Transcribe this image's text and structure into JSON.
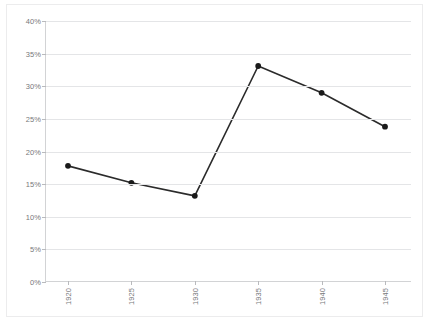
{
  "chart_data": {
    "type": "line",
    "title": "",
    "subtitle": "",
    "xlabel": "",
    "ylabel": "",
    "categories": [
      "1920",
      "1925",
      "1930",
      "1935",
      "1940",
      "1945"
    ],
    "x": [
      1920,
      1925,
      1930,
      1935,
      1940,
      1945
    ],
    "values": [
      17.8,
      15.2,
      13.2,
      33.1,
      29.0,
      23.8
    ],
    "value_labels": [
      "17.8%",
      "15.2%",
      "13.2%",
      "33.1%",
      "29.0%",
      "23.8%"
    ],
    "series": [
      {
        "name": "",
        "values": [
          17.8,
          15.2,
          13.2,
          33.1,
          29.0,
          23.8
        ]
      }
    ],
    "ylim": [
      0,
      40
    ],
    "ytick_step": 5,
    "ytick_labels": [
      "0%",
      "5%",
      "10%",
      "15%",
      "20%",
      "25%",
      "30%",
      "35%",
      "40%"
    ],
    "ytick_values": [
      0,
      5,
      10,
      15,
      20,
      25,
      30,
      35,
      40
    ],
    "xtick_labels": [
      "1920",
      "1925",
      "1930",
      "1935",
      "1940",
      "1945"
    ],
    "xtick_label_rotation": -90,
    "grid": true,
    "grid_axis": "y",
    "legend": false,
    "legend_position": "none",
    "annotations": [],
    "colors": {
      "line": "#2b2b2b",
      "marker": "#1a1a1a",
      "gridline": "#e4e5e7",
      "axis": "#d2d3d5",
      "tick_text": "#77787b",
      "border": "#ececed",
      "background": "#ffffff"
    },
    "marker_style": "filled-circle"
  }
}
